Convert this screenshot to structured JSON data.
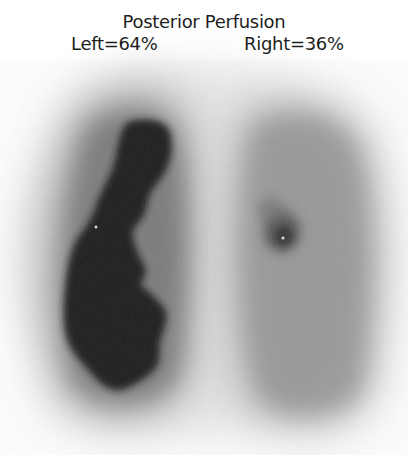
{
  "figure": {
    "title": "Posterior Perfusion",
    "view": "posterior",
    "modality": "lung perfusion scintigraphy"
  },
  "labels": {
    "left": "Left=64%",
    "right": "Right=36%"
  },
  "measurements": {
    "left_lung_percent": 64,
    "right_lung_percent": 36
  },
  "colors": {
    "background": "#ffffff",
    "text": "#1e1e1e",
    "left_core": "#1a1a1a",
    "right_parenchyma": "#8c8c8c"
  }
}
